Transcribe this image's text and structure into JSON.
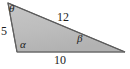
{
  "figure": {
    "type": "triangle-diagram",
    "fill_color": "#bdbdbd",
    "stroke_color": "#6e6e6e",
    "background_color": "#ffffff",
    "text_color": "#1c1c1c",
    "vertices": {
      "top": {
        "x": 8,
        "y": 3
      },
      "bottom_left": {
        "x": 17,
        "y": 52
      },
      "bottom_right": {
        "x": 125,
        "y": 52
      }
    },
    "angles": [
      {
        "id": "theta",
        "symbol": "θ",
        "vertex": "top"
      },
      {
        "id": "alpha",
        "symbol": "α",
        "vertex": "bottom_left"
      },
      {
        "id": "beta",
        "symbol": "β",
        "vertex": "bottom_right"
      }
    ],
    "sides": [
      {
        "id": "left",
        "label": "5",
        "between": [
          "top",
          "bottom_left"
        ]
      },
      {
        "id": "upper",
        "label": "12",
        "between": [
          "top",
          "bottom_right"
        ]
      },
      {
        "id": "bottom",
        "label": "10",
        "between": [
          "bottom_left",
          "bottom_right"
        ]
      }
    ]
  }
}
